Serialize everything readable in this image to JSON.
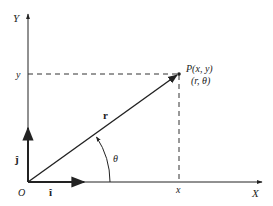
{
  "diagram": {
    "axes": {
      "x_label": "X",
      "y_label": "Y",
      "origin_label": "O"
    },
    "point": {
      "cartesian_label": "P(x, y)",
      "polar_label": "(r, θ)"
    },
    "projections": {
      "x_label": "x",
      "y_label": "y"
    },
    "vectors": {
      "position_label": "r",
      "unit_i_label": "î",
      "unit_j_label": "ĵ"
    },
    "angle_label": "θ",
    "colors": {
      "stroke": "#222222",
      "background": "#ffffff"
    }
  }
}
